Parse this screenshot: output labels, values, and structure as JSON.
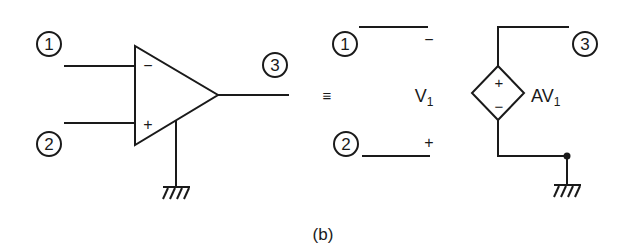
{
  "figure": {
    "caption": "(b)",
    "equivalence_symbol": "≡"
  },
  "opamp": {
    "node_labels": [
      "1",
      "2",
      "3"
    ],
    "inverting_sign": "−",
    "noninverting_sign": "+"
  },
  "equivalent": {
    "node_labels": [
      "1",
      "2",
      "3"
    ],
    "top_sign": "−",
    "bottom_sign": "+",
    "input_voltage": "V",
    "input_voltage_sub": "1",
    "source_plus": "+",
    "source_minus": "−",
    "source_gain": "AV",
    "source_gain_sub": "1"
  },
  "colors": {
    "ink": "#1a1a1a",
    "background": "#ffffff"
  }
}
